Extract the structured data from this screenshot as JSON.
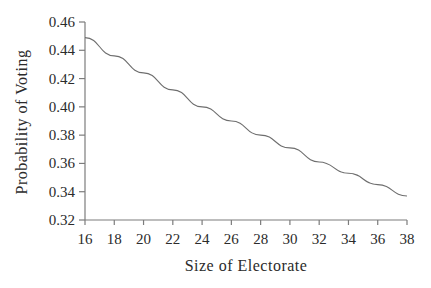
{
  "figure": {
    "background": "#ffffff",
    "text_color": "#2b2b2b",
    "axis_color": "#7c7c7c",
    "line_color": "#6e6e6e"
  },
  "chart_data": {
    "type": "line",
    "title": "",
    "xlabel": "Size of Electorate",
    "ylabel": "Probability of Voting",
    "x": [
      16,
      18,
      20,
      22,
      24,
      26,
      28,
      30,
      32,
      34,
      36,
      38
    ],
    "series": [
      {
        "name": "probability-of-voting",
        "values": [
          0.449,
          0.436,
          0.424,
          0.412,
          0.4,
          0.39,
          0.38,
          0.371,
          0.361,
          0.353,
          0.345,
          0.337
        ]
      }
    ],
    "xlim": [
      16,
      38
    ],
    "ylim": [
      0.32,
      0.46
    ],
    "x_ticks": [
      16,
      18,
      20,
      22,
      24,
      26,
      28,
      30,
      32,
      34,
      36,
      38
    ],
    "y_ticks": [
      0.32,
      0.34,
      0.36,
      0.38,
      0.4,
      0.42,
      0.44,
      0.46
    ],
    "y_tick_decimals": 2,
    "grid": false,
    "legend_position": "none"
  }
}
